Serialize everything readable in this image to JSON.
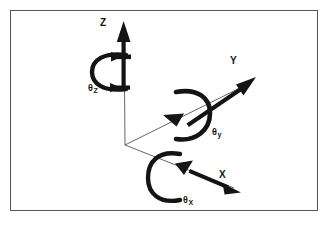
{
  "figure": {
    "kind": "3d-axes-rotation-diagram",
    "caption": "",
    "background_color": "#ffffff",
    "border_color": "#555555",
    "ink_color": "#141414",
    "origin": {
      "x": 125,
      "y": 145
    },
    "axes": [
      {
        "id": "z",
        "label": "Z",
        "label_pos": {
          "x": 100,
          "y": 18
        },
        "direction": "up",
        "tip": {
          "x": 124,
          "y": 22
        },
        "arrow_color": "#141414"
      },
      {
        "id": "y",
        "label": "Y",
        "label_pos": {
          "x": 230,
          "y": 56
        },
        "direction": "upper-right",
        "tip": {
          "x": 255,
          "y": 78
        },
        "arrow_color": "#141414"
      },
      {
        "id": "x",
        "label": "X",
        "label_pos": {
          "x": 219,
          "y": 170
        },
        "direction": "lower-right",
        "tip": {
          "x": 240,
          "y": 192
        },
        "arrow_color": "#141414"
      }
    ],
    "rotations": [
      {
        "id": "theta-z",
        "symbol": "θ",
        "subscript": "Z",
        "about_axis": "z",
        "label_pos": {
          "x": 88,
          "y": 84
        },
        "loop_opening": "right",
        "arrow_color": "#141414"
      },
      {
        "id": "theta-y",
        "symbol": "θ",
        "subscript": "y",
        "about_axis": "y",
        "label_pos": {
          "x": 212,
          "y": 128
        },
        "loop_opening": "left",
        "arrow_color": "#141414"
      },
      {
        "id": "theta-x",
        "symbol": "θ",
        "subscript": "X",
        "about_axis": "x",
        "label_pos": {
          "x": 183,
          "y": 196
        },
        "loop_opening": "right",
        "arrow_color": "#141414"
      }
    ]
  }
}
